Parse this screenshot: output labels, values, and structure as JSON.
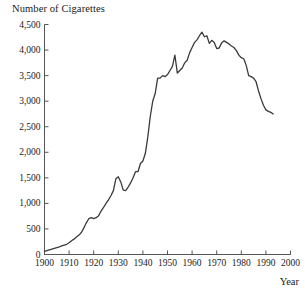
{
  "chart_data": {
    "type": "line",
    "title": "Number of Cigarettes",
    "xlabel": "Year",
    "ylabel": "",
    "xlim": [
      1900,
      2000
    ],
    "ylim": [
      0,
      4500
    ],
    "grid": false,
    "legend": "none",
    "line_color": "#3a3a3a",
    "background_color": "#ffffff",
    "xticks": [
      1900,
      1910,
      1920,
      1930,
      1940,
      1950,
      1960,
      1970,
      1980,
      1990,
      2000
    ],
    "xtick_labels": [
      "1900",
      "1910",
      "1920",
      "1930",
      "1940",
      "1950",
      "1960",
      "1970",
      "1980",
      "1990",
      "2000"
    ],
    "yticks": [
      0,
      500,
      1000,
      1500,
      2000,
      2500,
      3000,
      3500,
      4000,
      4500
    ],
    "ytick_labels": [
      "0",
      "500",
      "1,000",
      "1,500",
      "2,000",
      "2,500",
      "3,000",
      "3,500",
      "4,000",
      "4,500"
    ],
    "series": [
      {
        "name": "Number of Cigarettes",
        "x": [
          1900,
          1901,
          1902,
          1903,
          1904,
          1905,
          1906,
          1907,
          1908,
          1909,
          1910,
          1911,
          1912,
          1913,
          1914,
          1915,
          1916,
          1917,
          1918,
          1919,
          1920,
          1921,
          1922,
          1923,
          1924,
          1925,
          1926,
          1927,
          1928,
          1929,
          1930,
          1931,
          1932,
          1933,
          1934,
          1935,
          1936,
          1937,
          1938,
          1939,
          1940,
          1941,
          1942,
          1943,
          1944,
          1945,
          1946,
          1947,
          1948,
          1949,
          1950,
          1951,
          1952,
          1953,
          1954,
          1955,
          1956,
          1957,
          1958,
          1959,
          1960,
          1961,
          1962,
          1963,
          1964,
          1965,
          1966,
          1967,
          1968,
          1969,
          1970,
          1971,
          1972,
          1973,
          1974,
          1975,
          1976,
          1977,
          1978,
          1979,
          1980,
          1981,
          1982,
          1983,
          1984,
          1985,
          1986,
          1987,
          1988,
          1989,
          1990,
          1991,
          1992,
          1993
        ],
        "values": [
          60,
          75,
          90,
          105,
          120,
          135,
          150,
          170,
          185,
          200,
          230,
          270,
          300,
          340,
          380,
          430,
          520,
          620,
          700,
          720,
          700,
          720,
          760,
          850,
          920,
          1000,
          1070,
          1150,
          1250,
          1480,
          1520,
          1420,
          1260,
          1250,
          1320,
          1400,
          1500,
          1620,
          1620,
          1780,
          1830,
          1980,
          2300,
          2700,
          3000,
          3150,
          3450,
          3450,
          3500,
          3480,
          3520,
          3600,
          3680,
          3900,
          3550,
          3600,
          3650,
          3750,
          3800,
          3950,
          4050,
          4150,
          4200,
          4280,
          4350,
          4260,
          4280,
          4130,
          4190,
          4150,
          4030,
          4040,
          4140,
          4180,
          4150,
          4120,
          4080,
          4050,
          3990,
          3900,
          3850,
          3830,
          3700,
          3500,
          3480,
          3450,
          3380,
          3200,
          3050,
          2920,
          2830,
          2800,
          2780,
          2750
        ]
      }
    ]
  },
  "axes": {
    "title_text": "Number of Cigarettes",
    "x_axis_label": "Year"
  }
}
